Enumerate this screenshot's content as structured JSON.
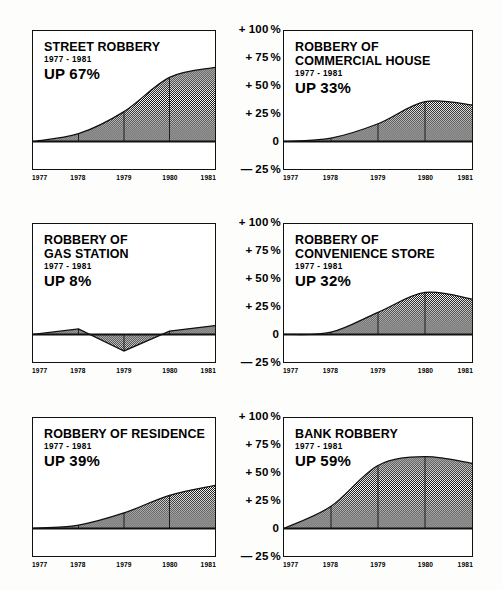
{
  "axis": {
    "labels": [
      {
        "sign": "+",
        "value": "100",
        "unit": "%",
        "pct": 100
      },
      {
        "sign": "+",
        "value": "75",
        "unit": "%",
        "pct": 75
      },
      {
        "sign": "+",
        "value": "50",
        "unit": "%",
        "pct": 50
      },
      {
        "sign": "+",
        "value": "25",
        "unit": "%",
        "pct": 25
      },
      {
        "sign": "",
        "value": "0",
        "unit": "",
        "pct": 0
      },
      {
        "sign": "—",
        "value": "25",
        "unit": "%",
        "pct": -25
      }
    ],
    "ymin": -25,
    "ymax": 100
  },
  "years": [
    "1977",
    "1978",
    "1979",
    "1980",
    "1981"
  ],
  "colors": {
    "ink": "#111111",
    "fill": "#9a9a9a",
    "paper": "#fdfdfc"
  },
  "chart_data": [
    {
      "type": "area",
      "id": "street-robbery",
      "title": "STREET ROBBERY",
      "title_lines": [
        "STREET ROBBERY"
      ],
      "subtitle": "1977 - 1981",
      "change_label": "UP 67%",
      "categories": [
        "1977",
        "1978",
        "1979",
        "1980",
        "1981"
      ],
      "values": [
        0,
        7,
        27,
        58,
        67
      ],
      "ylabel": "",
      "xlabel": "",
      "ylim": [
        -25,
        100
      ],
      "grid": false,
      "position": "row1-left"
    },
    {
      "type": "area",
      "id": "robbery-of-commercial-house",
      "title": "ROBBERY OF COMMERCIAL HOUSE",
      "title_lines": [
        "ROBBERY OF",
        "COMMERCIAL HOUSE"
      ],
      "subtitle": "1977 - 1981",
      "change_label": "UP 33%",
      "categories": [
        "1977",
        "1978",
        "1979",
        "1980",
        "1981"
      ],
      "values": [
        0,
        3,
        16,
        36,
        33
      ],
      "ylabel": "",
      "xlabel": "",
      "ylim": [
        -25,
        100
      ],
      "grid": false,
      "position": "row1-right"
    },
    {
      "type": "area",
      "id": "robbery-of-gas-station",
      "title": "ROBBERY OF GAS STATION",
      "title_lines": [
        "ROBBERY OF",
        "GAS STATION"
      ],
      "subtitle": "1977 - 1981",
      "change_label": "UP 8%",
      "categories": [
        "1977",
        "1978",
        "1979",
        "1980",
        "1981"
      ],
      "values": [
        0,
        5,
        -15,
        3,
        8
      ],
      "ylabel": "",
      "xlabel": "",
      "ylim": [
        -25,
        100
      ],
      "grid": false,
      "position": "row2-left"
    },
    {
      "type": "area",
      "id": "robbery-of-convenience-store",
      "title": "ROBBERY OF CONVENIENCE STORE",
      "title_lines": [
        "ROBBERY OF",
        "CONVENIENCE STORE"
      ],
      "subtitle": "1977 - 1981",
      "change_label": "UP 32%",
      "categories": [
        "1977",
        "1978",
        "1979",
        "1980",
        "1981"
      ],
      "values": [
        0,
        2,
        20,
        38,
        32
      ],
      "ylabel": "",
      "xlabel": "",
      "ylim": [
        -25,
        100
      ],
      "grid": false,
      "position": "row2-right"
    },
    {
      "type": "area",
      "id": "robbery-of-residence",
      "title": "ROBBERY OF RESIDENCE",
      "title_lines": [
        "ROBBERY OF RESIDENCE"
      ],
      "subtitle": "1977 - 1981",
      "change_label": "UP 39%",
      "categories": [
        "1977",
        "1978",
        "1979",
        "1980",
        "1981"
      ],
      "values": [
        0,
        3,
        14,
        30,
        39
      ],
      "ylabel": "",
      "xlabel": "",
      "ylim": [
        -25,
        100
      ],
      "grid": false,
      "position": "row3-left"
    },
    {
      "type": "area",
      "id": "bank-robbery",
      "title": "BANK ROBBERY",
      "title_lines": [
        "BANK ROBBERY"
      ],
      "subtitle": "1977 - 1981",
      "change_label": "UP 59%",
      "categories": [
        "1977",
        "1978",
        "1979",
        "1980",
        "1981"
      ],
      "values": [
        0,
        20,
        57,
        65,
        59
      ],
      "ylabel": "",
      "xlabel": "",
      "ylim": [
        -25,
        100
      ],
      "grid": false,
      "position": "row3-right"
    }
  ]
}
